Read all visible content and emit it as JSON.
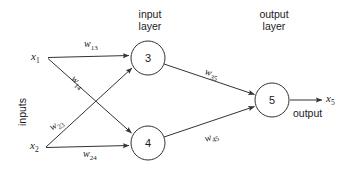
{
  "diagram": {
    "style": {
      "stroke_color": "#333333",
      "text_color": "#1a1a1a",
      "background": "#ffffff",
      "stroke_width": 1
    },
    "layer_titles": {
      "input": "input\nlayer",
      "input_line1": "input",
      "input_line2": "layer",
      "output_line1": "output",
      "output_line2": "layer"
    },
    "side_label": "inputs",
    "output_label": "output",
    "inputs": [
      {
        "id": "x1",
        "label": "x",
        "sub": "1"
      },
      {
        "id": "x2",
        "label": "x",
        "sub": "2"
      }
    ],
    "outputs": [
      {
        "id": "x5",
        "label": "x",
        "sub": "5"
      }
    ],
    "nodes": [
      {
        "id": "n3",
        "number": "3",
        "cx": 148,
        "cy": 58,
        "r": 17,
        "layer": "input"
      },
      {
        "id": "n4",
        "number": "4",
        "cx": 148,
        "cy": 143,
        "r": 17,
        "layer": "input"
      },
      {
        "id": "n5",
        "number": "5",
        "cx": 272,
        "cy": 100,
        "r": 17,
        "layer": "output"
      }
    ],
    "weights": [
      {
        "id": "w13",
        "label": "w",
        "sub": "13",
        "from": "x1",
        "to": "n3",
        "rotation": 0
      },
      {
        "id": "w14",
        "label": "w",
        "sub": "14",
        "from": "x1",
        "to": "n4",
        "rotation": 42
      },
      {
        "id": "w23",
        "label": "w",
        "sub": "23",
        "from": "x2",
        "to": "n3",
        "rotation": -33
      },
      {
        "id": "w24",
        "label": "w",
        "sub": "24",
        "from": "x2",
        "to": "n4",
        "rotation": 0
      },
      {
        "id": "w35",
        "label": "w",
        "sub": "35",
        "from": "n3",
        "to": "n5",
        "rotation": 19
      },
      {
        "id": "w45",
        "label": "w",
        "sub": "45",
        "from": "n4",
        "to": "n5",
        "rotation": -19
      }
    ]
  }
}
